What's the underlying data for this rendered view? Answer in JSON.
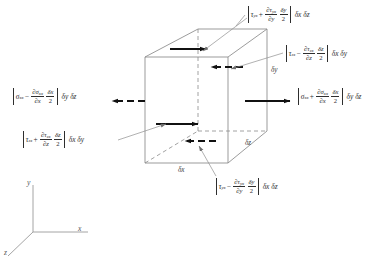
{
  "figure": {
    "type": "stress-element-diagram",
    "element_shape": "cube",
    "stroke_color": "#888888",
    "arrow_color": "#1a1a1a",
    "text_color": "#2e2e2e"
  },
  "labels": {
    "top_face": {
      "name": "tau-yx-plus",
      "stress": "τ",
      "stress_sub": "yx",
      "operator": "+",
      "partial_num": "∂τ",
      "partial_num_sub": "yx",
      "partial_den": "∂y",
      "delta_num": "δy",
      "delta_den": "2",
      "area": "δx δz",
      "arrow": "solid-right"
    },
    "back_face": {
      "name": "tau-zx-minus",
      "stress": "τ",
      "stress_sub": "zx",
      "operator": "−",
      "partial_num": "∂τ",
      "partial_num_sub": "zx",
      "partial_den": "∂z",
      "delta_num": "δz",
      "delta_den": "2",
      "area": "δx δy",
      "arrow": "dashed-left"
    },
    "left_face": {
      "name": "sigma-xx-minus",
      "stress": "σ",
      "stress_sub": "xx",
      "operator": "−",
      "partial_num": "∂σ",
      "partial_num_sub": "xx",
      "partial_den": "∂x",
      "delta_num": "δx",
      "delta_den": "2",
      "area": "δy δz",
      "arrow": "dashed-left"
    },
    "right_face": {
      "name": "sigma-xx-plus",
      "stress": "σ",
      "stress_sub": "xx",
      "operator": "+",
      "partial_num": "∂σ",
      "partial_num_sub": "xx",
      "partial_den": "∂x",
      "delta_num": "δx",
      "delta_den": "2",
      "area": "δy δz",
      "arrow": "solid-right"
    },
    "front_face": {
      "name": "tau-zx-plus",
      "stress": "τ",
      "stress_sub": "zx",
      "operator": "+",
      "partial_num": "∂τ",
      "partial_num_sub": "zx",
      "partial_den": "∂z",
      "delta_num": "δz",
      "delta_den": "2",
      "area": "δx δy",
      "arrow": "solid-right"
    },
    "bottom_face": {
      "name": "tau-yx-minus",
      "stress": "τ",
      "stress_sub": "yx",
      "operator": "−",
      "partial_num": "∂τ",
      "partial_num_sub": "yx",
      "partial_den": "∂y",
      "delta_num": "δy",
      "delta_den": "2",
      "area": "δx δz",
      "arrow": "dashed-left"
    }
  },
  "dimensions": {
    "dy": "δy",
    "dz": "δz",
    "dx": "δx"
  },
  "axes": {
    "y": "y",
    "x": "x",
    "z": "z"
  }
}
